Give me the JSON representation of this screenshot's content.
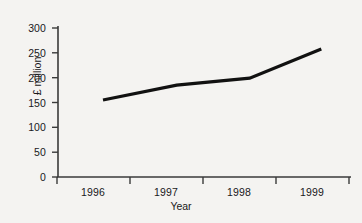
{
  "chart_data": {
    "type": "line",
    "title": "",
    "subtitle": "",
    "xlabel": "Year",
    "ylabel": "£ million",
    "categories": [
      "1996",
      "1997",
      "1998",
      "1999"
    ],
    "series": [
      {
        "name": "",
        "values": [
          155,
          185,
          199,
          258
        ]
      }
    ],
    "x_tick_labels": [
      "1996",
      "1997",
      "1998",
      "1999"
    ],
    "y_tick_labels": [
      "0",
      "50",
      "100",
      "150",
      "200",
      "250",
      "300"
    ],
    "y_ticks": [
      0,
      50,
      100,
      150,
      200,
      250,
      300
    ],
    "ylim": [
      0,
      300
    ],
    "grid": false,
    "legend": false,
    "legend_position": "none",
    "line_color": "#111111",
    "axis_color": "#3a3a3a",
    "background_color": "#f4f3f1"
  }
}
